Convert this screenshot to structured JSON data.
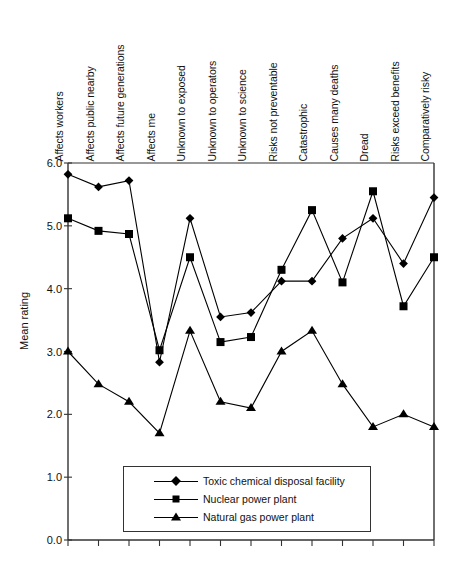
{
  "chart_data": {
    "type": "line",
    "title": "",
    "xlabel": "",
    "ylabel": "Mean rating",
    "ylim": [
      0.0,
      6.0
    ],
    "ytick_labels": [
      "0.0",
      "1.0",
      "2.0",
      "3.0",
      "4.0",
      "5.0",
      "6.0"
    ],
    "ytick_values": [
      0.0,
      1.0,
      2.0,
      3.0,
      4.0,
      5.0,
      6.0
    ],
    "grid": false,
    "legend_position": "lower-center-inside",
    "categories": [
      "Affects workers",
      "Affects public nearby",
      "Affects future generations",
      "Affects me",
      "Unknown to exposed",
      "Unknown to operators",
      "Unknown to science",
      "Risks not preventable",
      "Catastrophic",
      "Causes many deaths",
      "Dread",
      "Risks exceed benefits",
      "Comparatively risky"
    ],
    "series": [
      {
        "name": "Toxic chemical disposal facility",
        "marker": "diamond",
        "values": [
          5.82,
          5.62,
          5.72,
          2.83,
          5.12,
          3.55,
          3.62,
          4.12,
          4.12,
          4.8,
          5.12,
          4.4,
          5.45
        ]
      },
      {
        "name": "Nuclear power plant",
        "marker": "square",
        "values": [
          5.12,
          4.92,
          4.87,
          3.02,
          4.5,
          3.15,
          3.23,
          4.3,
          5.25,
          4.1,
          5.55,
          3.72,
          4.5
        ]
      },
      {
        "name": "Natural gas power plant",
        "marker": "triangle",
        "values": [
          3.0,
          2.48,
          2.2,
          1.7,
          3.33,
          2.2,
          2.1,
          3.0,
          3.33,
          2.48,
          1.8,
          2.0,
          1.8
        ]
      }
    ]
  },
  "legend": {
    "entries": [
      {
        "label": "Toxic chemical disposal facility",
        "marker": "diamond"
      },
      {
        "label": "Nuclear power plant",
        "marker": "square"
      },
      {
        "label": "Natural gas power plant",
        "marker": "triangle"
      }
    ]
  },
  "colors": {
    "ink": "#000000",
    "axis": "#333333",
    "background": "#ffffff"
  }
}
